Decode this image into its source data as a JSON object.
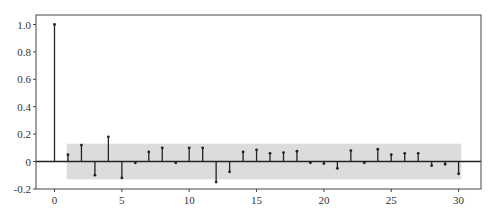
{
  "chart_data": {
    "type": "bar",
    "subtype": "stem (autocorrelation function plot)",
    "title": "",
    "xlabel": "",
    "ylabel": "",
    "x": [
      0,
      1,
      2,
      3,
      4,
      5,
      6,
      7,
      8,
      9,
      10,
      11,
      12,
      13,
      14,
      15,
      16,
      17,
      18,
      19,
      20,
      21,
      22,
      23,
      24,
      25,
      26,
      27,
      28,
      29,
      30
    ],
    "values": [
      1.0,
      0.05,
      0.12,
      -0.1,
      0.18,
      -0.12,
      -0.01,
      0.07,
      0.1,
      -0.01,
      0.1,
      0.1,
      -0.15,
      -0.075,
      0.07,
      0.085,
      0.06,
      0.065,
      0.075,
      -0.01,
      -0.015,
      -0.05,
      0.08,
      -0.01,
      0.09,
      0.05,
      0.06,
      0.06,
      -0.03,
      -0.02,
      -0.09
    ],
    "confidence_band": {
      "upper": 0.13,
      "lower": -0.13,
      "x_start": 0.9,
      "x_end": 30.2,
      "color": "#dcdcdc"
    },
    "xlim": [
      -1.4,
      31.6
    ],
    "ylim": [
      -0.2,
      1.05
    ],
    "xticks": [
      0,
      5,
      10,
      15,
      20,
      25,
      30
    ],
    "xtick_labels": [
      "0",
      "5",
      "10",
      "15",
      "20",
      "25",
      "30"
    ],
    "yticks": [
      -0.2,
      0,
      0.2,
      0.4,
      0.6,
      0.8,
      1.0
    ],
    "ytick_labels": [
      "-0.2",
      "0",
      "0.2",
      "0.4",
      "0.6",
      "0.8",
      "1.0"
    ],
    "grid": false,
    "legend": null,
    "colors": {
      "stem": "#222222",
      "zero_line": "#222222",
      "frame": "#444444"
    }
  }
}
